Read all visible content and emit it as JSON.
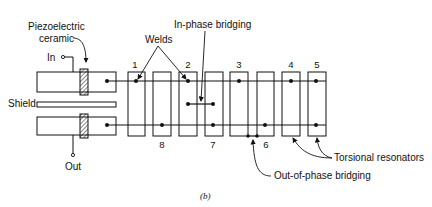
{
  "figure": {
    "caption": "(b)",
    "labels": {
      "piezo_line1": "Piezoelectric",
      "piezo_line2": "ceramic",
      "in": "In",
      "out": "Out",
      "shield": "Shield",
      "welds": "Welds",
      "in_phase": "In-phase bridging",
      "out_phase": "Out-of-phase bridging",
      "torsional": "Torsional resonators"
    },
    "resonator_numbers": {
      "top": [
        "1",
        "2",
        "3",
        "4",
        "5"
      ],
      "bottom": [
        "8",
        "7",
        "6"
      ]
    },
    "colors": {
      "ink": "#111111",
      "background": "#ffffff"
    }
  }
}
